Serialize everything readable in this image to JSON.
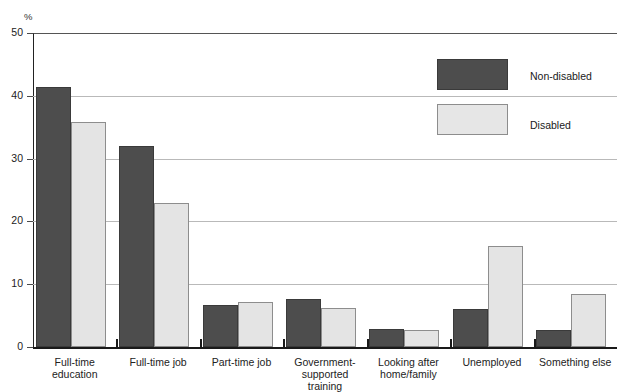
{
  "figure": {
    "clipped_title": "",
    "unit_label": "%"
  },
  "legend": {
    "items": [
      {
        "label": "Non-disabled",
        "color": "#4d4d4d"
      },
      {
        "label": "Disabled",
        "color": "#e6e6e6"
      }
    ]
  },
  "axis": {
    "y_ticks": [
      "0",
      "10",
      "20",
      "30",
      "40",
      "50"
    ]
  },
  "chart_data": {
    "type": "bar",
    "title": "",
    "xlabel": "",
    "ylabel": "%",
    "ylim": [
      0,
      50
    ],
    "yticks": [
      0,
      10,
      20,
      30,
      40,
      50
    ],
    "grid": true,
    "legend_position": "top-right",
    "categories": [
      "Full-time education",
      "Full-time job",
      "Part-time job",
      "Government-supported training",
      "Looking after home/family",
      "Unemployed",
      "Something else"
    ],
    "category_lines": [
      [
        "Full-time education"
      ],
      [
        "Full-time job"
      ],
      [
        "Part-time job"
      ],
      [
        "Government-",
        "supported training"
      ],
      [
        "Looking after",
        "home/family"
      ],
      [
        "Unemployed"
      ],
      [
        "Something else"
      ]
    ],
    "series": [
      {
        "name": "Non-disabled",
        "color": "#4d4d4d",
        "values": [
          41.4,
          32.0,
          6.7,
          7.7,
          2.9,
          6.0,
          2.7
        ]
      },
      {
        "name": "Disabled",
        "color": "#e6e6e6",
        "values": [
          35.8,
          23.0,
          7.1,
          6.2,
          2.7,
          16.1,
          8.4
        ]
      }
    ]
  }
}
